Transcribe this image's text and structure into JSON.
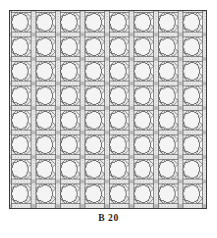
{
  "figure": {
    "caption": "B 20",
    "plate_label": "B 20",
    "frame": {
      "visible": true,
      "shape": "rectangle"
    }
  },
  "pattern": {
    "name": "cane-webbing-lattice",
    "grid_columns": 8,
    "grid_rows": 8,
    "cell_count": 64,
    "opening_shape": "octagon",
    "strap_directions": [
      "horizontal",
      "vertical",
      "diagonal-down",
      "diagonal-up"
    ],
    "weave": "over-under",
    "cell_pitch_px": 24.5,
    "opening_radius_px": 8.2
  },
  "colors": {
    "background": "#ffffff",
    "ink": "#4a4a4a",
    "ink_dark": "#2e2e2e",
    "strap_fill": "#e6e6e6",
    "opening_fill": "#f2f2f2",
    "caption": "#1d1d1d",
    "frame": "#3a3a3a"
  },
  "render": {
    "plate_left_px": 9,
    "plate_top_px": 10,
    "plate_width_px": 198,
    "plate_height_px": 199,
    "caption_top_px": 212
  }
}
